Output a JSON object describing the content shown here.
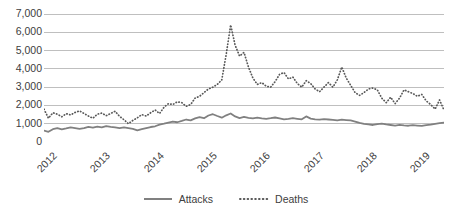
{
  "chart_data": {
    "type": "line",
    "title": "",
    "subtitle": "",
    "xlabel": "",
    "ylabel": "",
    "ylim": [
      0,
      7000
    ],
    "ytick_values": [
      7000,
      6000,
      5000,
      4000,
      3000,
      2000,
      1000,
      0
    ],
    "ytick_labels": [
      "7,000",
      "6,000",
      "5,000",
      "4,000",
      "3,000",
      "2,000",
      "1,000",
      "0"
    ],
    "grid": "horizontal",
    "legend_position": "bottom",
    "x_type": "monthly",
    "x_start": "2012-01",
    "x_end": "2019-06",
    "xtick_labels": [
      "2012",
      "2013",
      "2014",
      "2015",
      "2016",
      "2017",
      "2018",
      "2019"
    ],
    "xtick_index": [
      0,
      12,
      24,
      36,
      48,
      60,
      72,
      84
    ],
    "colors": {
      "attacks": "#808080",
      "deaths": "#595959",
      "grid": "#bfbfbf",
      "axis": "#808080",
      "text": "#404040"
    },
    "series": [
      {
        "name": "Attacks",
        "style": "solid",
        "color": "#808080",
        "values": [
          620,
          560,
          700,
          760,
          690,
          740,
          800,
          760,
          720,
          760,
          830,
          790,
          840,
          800,
          870,
          830,
          800,
          760,
          800,
          760,
          720,
          640,
          700,
          760,
          820,
          860,
          950,
          1000,
          1060,
          1120,
          1080,
          1150,
          1230,
          1180,
          1290,
          1360,
          1300,
          1450,
          1520,
          1420,
          1330,
          1460,
          1560,
          1400,
          1310,
          1370,
          1320,
          1290,
          1330,
          1290,
          1270,
          1300,
          1340,
          1290,
          1240,
          1260,
          1300,
          1270,
          1240,
          1400,
          1280,
          1240,
          1220,
          1250,
          1230,
          1210,
          1180,
          1220,
          1200,
          1180,
          1120,
          1040,
          990,
          960,
          930,
          980,
          1010,
          960,
          930,
          900,
          940,
          910,
          890,
          920,
          900,
          880,
          920,
          950,
          990,
          1030,
          1060
        ]
      },
      {
        "name": "Deaths",
        "style": "dotted",
        "color": "#595959",
        "values": [
          1800,
          1300,
          1600,
          1520,
          1380,
          1550,
          1480,
          1620,
          1700,
          1560,
          1420,
          1300,
          1520,
          1580,
          1440,
          1560,
          1680,
          1400,
          1220,
          1000,
          1180,
          1320,
          1500,
          1420,
          1600,
          1750,
          1560,
          1900,
          2100,
          2050,
          2200,
          2150,
          1950,
          2050,
          2400,
          2500,
          2700,
          2900,
          3000,
          3150,
          3400,
          4800,
          6400,
          5300,
          4700,
          4900,
          4100,
          3500,
          3150,
          3250,
          3050,
          3000,
          3300,
          3700,
          3800,
          3450,
          3550,
          3200,
          3000,
          3350,
          3200,
          2900,
          2750,
          3000,
          3250,
          3000,
          3400,
          4100,
          3500,
          3100,
          2700,
          2550,
          2700,
          2900,
          2950,
          2850,
          2400,
          2150,
          2450,
          2100,
          2400,
          2850,
          2750,
          2650,
          2500,
          2600,
          2250,
          2050,
          1800,
          2300,
          1750
        ]
      }
    ]
  },
  "legend": {
    "items": [
      {
        "label": "Attacks",
        "style": "solid"
      },
      {
        "label": "Deaths",
        "style": "dotted"
      }
    ]
  }
}
